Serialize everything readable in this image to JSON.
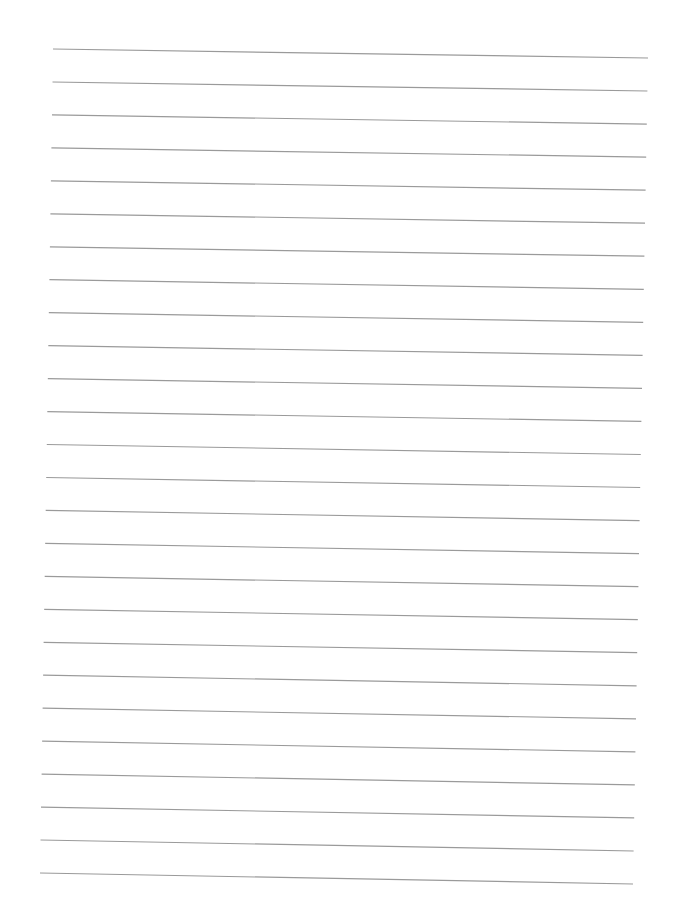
{
  "page": {
    "type": "lined-paper",
    "background_color": "#ffffff",
    "line_color": "#9a9a9a",
    "line_width": 1.2,
    "line_count": 26,
    "first_line": {
      "x1": 53,
      "y1": 49,
      "x2": 648,
      "y2": 58
    },
    "last_line": {
      "x1": 40,
      "y1": 873,
      "x2": 633,
      "y2": 884
    }
  }
}
